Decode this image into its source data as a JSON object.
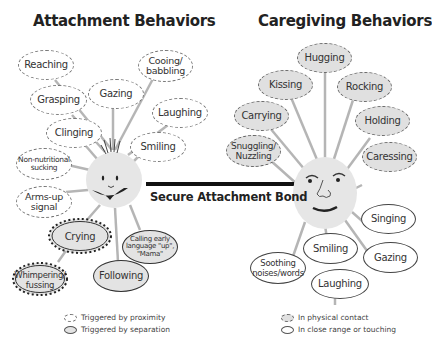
{
  "titles": {
    "left": "Attachment Behaviors",
    "right": "Caregiving Behaviors"
  },
  "bond": {
    "label": "Secure Attachment Bond"
  },
  "colors": {
    "face_fill": "#e6e6e6",
    "spoke": "#b5b5b5",
    "proximity_border": "#777777",
    "separation_fill": "#e3e3e3",
    "physical_contact_fill": "#e0e0e0",
    "close_range_fill": "#ffffff",
    "bond_bar": "#111111",
    "text": "#333333"
  },
  "attachment": {
    "proximity": [
      {
        "label": "Reaching"
      },
      {
        "label": "Cooing/ babbling"
      },
      {
        "label": "Gazing"
      },
      {
        "label": "Grasping"
      },
      {
        "label": "Laughing"
      },
      {
        "label": "Clinging"
      },
      {
        "label": "Smiling"
      },
      {
        "label": "Non-nutritional sucking"
      },
      {
        "label": "Arms-up signal"
      }
    ],
    "separation": [
      {
        "label": "Crying"
      },
      {
        "label": "Calling early language \"up\", \"Mama\""
      },
      {
        "label": "Whimpering/ fussing"
      },
      {
        "label": "Following"
      }
    ]
  },
  "caregiving": {
    "physical_contact": [
      {
        "label": "Hugging"
      },
      {
        "label": "Kissing"
      },
      {
        "label": "Rocking"
      },
      {
        "label": "Carrying"
      },
      {
        "label": "Holding"
      },
      {
        "label": "Snuggling/ Nuzzling"
      },
      {
        "label": "Caressing"
      }
    ],
    "close_range": [
      {
        "label": "Singing"
      },
      {
        "label": "Smiling"
      },
      {
        "label": "Gazing"
      },
      {
        "label": "Soothing noises/words"
      },
      {
        "label": "Laughing"
      }
    ]
  },
  "legend": {
    "left": [
      {
        "label": "Triggered by proximity"
      },
      {
        "label": "Triggered by separation"
      }
    ],
    "right": [
      {
        "label": "In physical contact"
      },
      {
        "label": "In close range or touching"
      }
    ]
  }
}
